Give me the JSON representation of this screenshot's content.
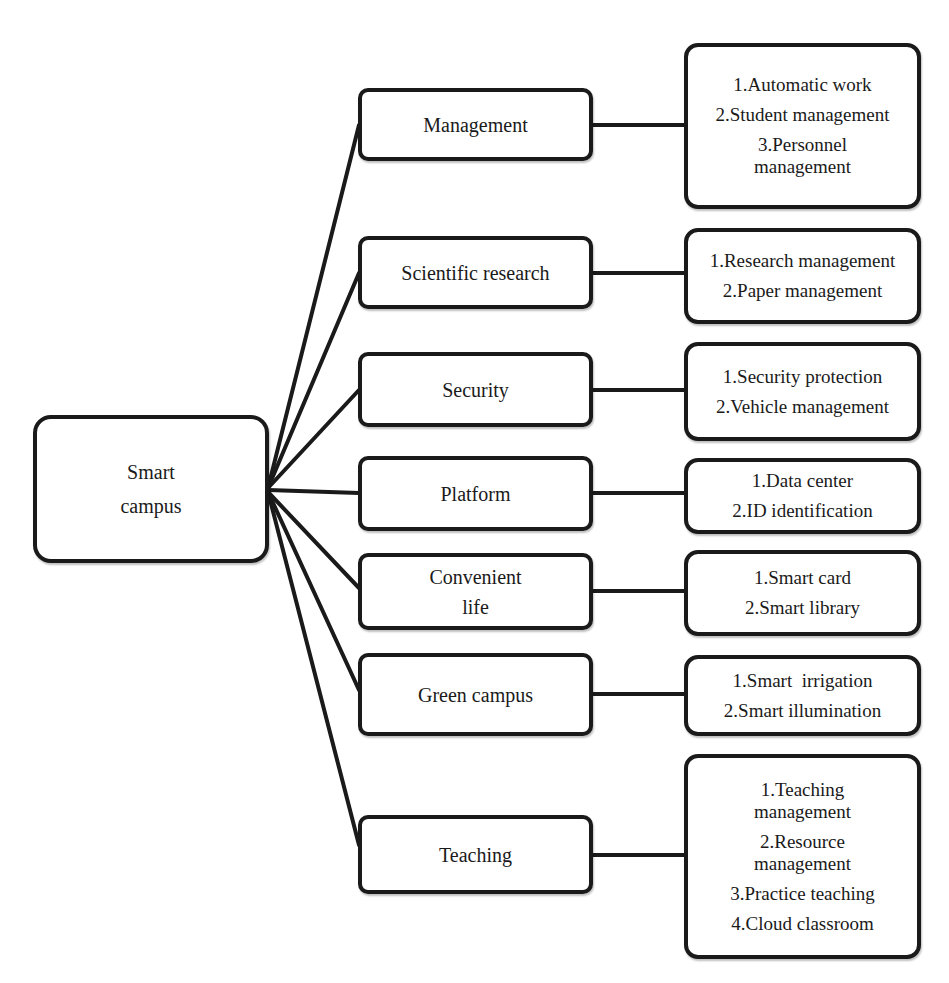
{
  "diagram": {
    "root": {
      "label_lines": [
        "Smart",
        "campus"
      ]
    },
    "categories": [
      {
        "label_lines": [
          "Management"
        ],
        "details": [
          [
            "1.Automatic work"
          ],
          [
            "2.Student management"
          ],
          [
            "3.Personnel",
            "management"
          ]
        ]
      },
      {
        "label_lines": [
          "Scientific research"
        ],
        "details": [
          [
            "1.Research management"
          ],
          [
            "2.Paper management"
          ]
        ]
      },
      {
        "label_lines": [
          "Security"
        ],
        "details": [
          [
            "1.Security protection"
          ],
          [
            "2.Vehicle management"
          ]
        ]
      },
      {
        "label_lines": [
          "Platform"
        ],
        "details": [
          [
            "1.Data center"
          ],
          [
            "2.ID identification"
          ]
        ]
      },
      {
        "label_lines": [
          "Convenient",
          "life"
        ],
        "details": [
          [
            "1.Smart card"
          ],
          [
            "2.Smart library"
          ]
        ]
      },
      {
        "label_lines": [
          "Green campus"
        ],
        "details": [
          [
            "1.Smart  irrigation"
          ],
          [
            "2.Smart illumination"
          ]
        ]
      },
      {
        "label_lines": [
          "Teaching"
        ],
        "details": [
          [
            "1.Teaching",
            "management"
          ],
          [
            "2.Resource",
            "management"
          ],
          [
            "3.Practice teaching"
          ],
          [
            "4.Cloud classroom"
          ]
        ]
      }
    ],
    "colors": {
      "stroke": "#1a1a1a",
      "fill": "#ffffff",
      "text": "#1a1a1a"
    }
  }
}
